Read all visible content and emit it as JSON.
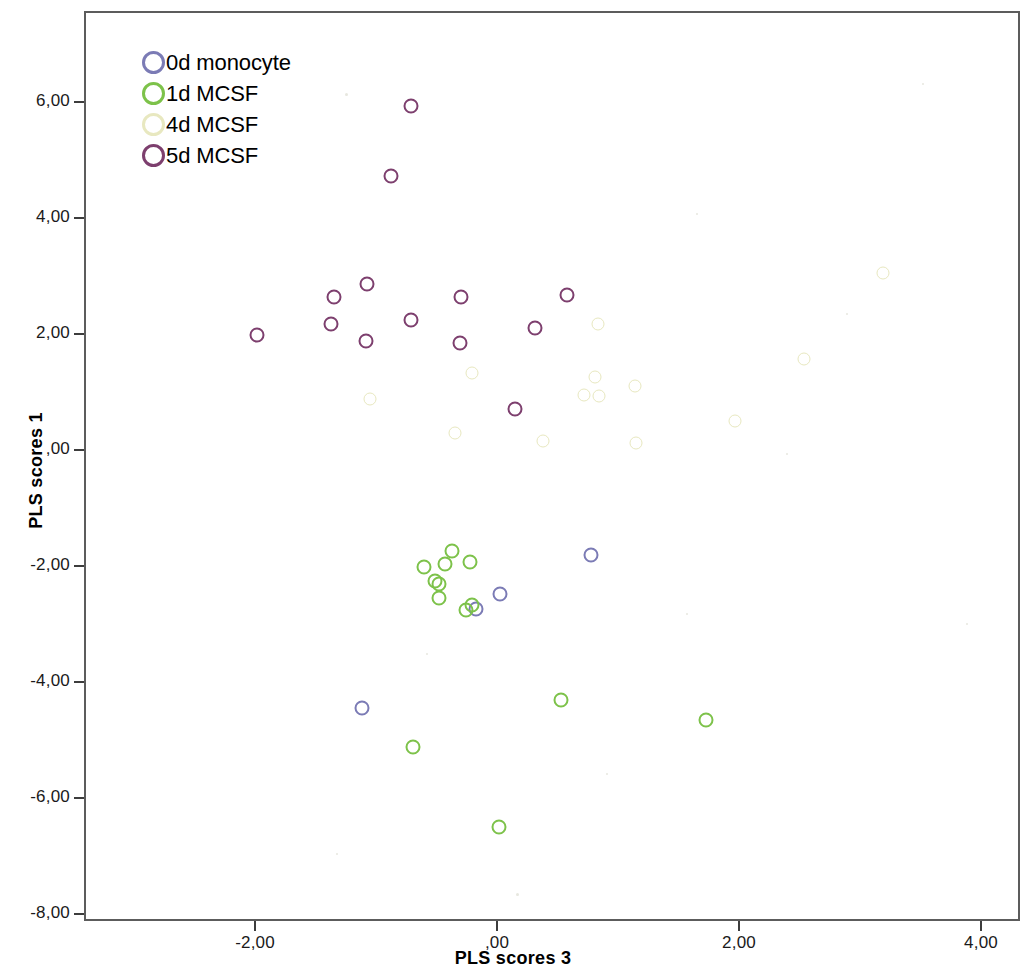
{
  "chart_data": {
    "type": "scatter",
    "title": "",
    "xlabel": "PLS scores 3",
    "ylabel": "PLS scores 1",
    "xlim": [
      -3.25,
      4.25
    ],
    "ylim": [
      -8.35,
      7.05
    ],
    "xticks": [
      "-2,00",
      ",00",
      "2,00",
      "4,00"
    ],
    "xtick_values": [
      -2,
      0,
      2,
      4
    ],
    "yticks": [
      "6,00",
      "4,00",
      "2,00",
      ",00",
      "-2,00",
      "-4,00",
      "-6,00",
      "-8,00"
    ],
    "ytick_values": [
      6,
      4,
      2,
      0,
      -2,
      -4,
      -6,
      -8
    ],
    "grid": false,
    "legend_position": "top-left",
    "series": [
      {
        "name": "0d monocyte",
        "color": "#7b7bb5",
        "points": [
          [
            0.76,
            -1.77
          ],
          [
            0.01,
            -2.44
          ],
          [
            -0.19,
            -2.7
          ],
          [
            -1.13,
            -4.41
          ]
        ]
      },
      {
        "name": "1d MCSF",
        "color": "#7dc24a",
        "points": [
          [
            -0.62,
            -1.98
          ],
          [
            -0.45,
            -1.93
          ],
          [
            -0.39,
            -1.71
          ],
          [
            -0.24,
            -1.9
          ],
          [
            -0.53,
            -2.22
          ],
          [
            -0.5,
            -2.27
          ],
          [
            -0.5,
            -2.52
          ],
          [
            -0.27,
            -2.72
          ],
          [
            -0.22,
            -2.64
          ],
          [
            -0.71,
            -5.09
          ],
          [
            0.51,
            -4.27
          ],
          [
            1.71,
            -4.62
          ],
          [
            0.0,
            -6.47
          ]
        ]
      },
      {
        "name": "4d MCSF",
        "color": "#e8e8c0",
        "points": [
          [
            3.17,
            3.08
          ],
          [
            0.82,
            2.21
          ],
          [
            2.52,
            1.61
          ],
          [
            -0.22,
            1.36
          ],
          [
            0.79,
            1.29
          ],
          [
            1.12,
            1.13
          ],
          [
            0.7,
            0.98
          ],
          [
            0.83,
            0.97
          ],
          [
            -1.07,
            0.91
          ],
          [
            1.95,
            0.54
          ],
          [
            -0.36,
            0.33
          ],
          [
            0.36,
            0.19
          ],
          [
            1.13,
            0.16
          ]
        ]
      },
      {
        "name": "5d MCSF",
        "color": "#7d3f6e",
        "points": [
          [
            -0.73,
            5.96
          ],
          [
            -0.89,
            4.76
          ],
          [
            -1.09,
            2.9
          ],
          [
            -1.36,
            2.67
          ],
          [
            -0.31,
            2.67
          ],
          [
            0.56,
            2.7
          ],
          [
            -1.39,
            2.21
          ],
          [
            -0.73,
            2.27
          ],
          [
            0.3,
            2.14
          ],
          [
            -2.0,
            2.01
          ],
          [
            -1.1,
            1.91
          ],
          [
            -0.32,
            1.88
          ],
          [
            0.13,
            0.74
          ]
        ]
      }
    ]
  },
  "legend": {
    "items": [
      {
        "label": "0d monocyte",
        "color": "#7b7bb5"
      },
      {
        "label": "1d MCSF",
        "color": "#7dc24a"
      },
      {
        "label": "4d MCSF",
        "color": "#e8e8c0"
      },
      {
        "label": "5d MCSF",
        "color": "#7d3f6e"
      }
    ]
  }
}
